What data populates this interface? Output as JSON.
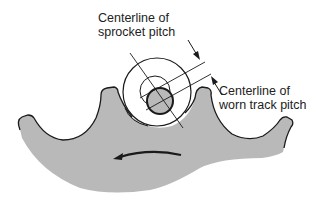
{
  "diagram": {
    "labels": {
      "sprocket_pitch_line1": "Centerline of",
      "sprocket_pitch_line2": "sprocket pitch",
      "track_pitch_line1": "Centerline of",
      "track_pitch_line2": "worn track pitch"
    },
    "components": [
      {
        "name": "sprocket",
        "description": "gray sprocket segment with four teeth"
      },
      {
        "name": "track-bushing",
        "description": "large outer circle"
      },
      {
        "name": "pin",
        "description": "shaded pin circle offset from bushing center"
      },
      {
        "name": "rotation-arrow",
        "description": "curved arrow pointing left indicating rotation direction"
      }
    ],
    "colors": {
      "sprocket_fill": "#b9b9b9",
      "outline": "#1a1a1a",
      "background": "#ffffff"
    }
  }
}
